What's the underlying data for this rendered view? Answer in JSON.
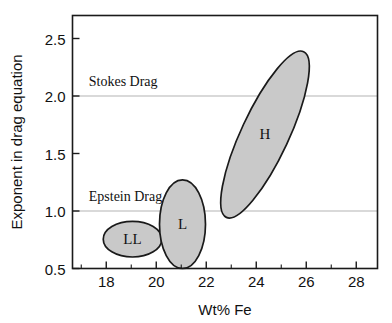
{
  "chart_data": {
    "type": "scatter",
    "title": "",
    "xlabel": "Wt% Fe",
    "ylabel": "Exponent in drag equation",
    "xlim": [
      16.65,
      28.85
    ],
    "ylim": [
      0.5,
      2.7
    ],
    "grid": true,
    "legend_position": "none",
    "xticks": [
      18,
      20,
      22,
      24,
      26,
      28
    ],
    "xtick_labels": [
      "18",
      "20",
      "22",
      "24",
      "26",
      "28"
    ],
    "xminor_ticks": [
      17,
      19,
      21,
      23,
      25,
      27
    ],
    "yticks": [
      0.5,
      1.0,
      1.5,
      2.0,
      2.5
    ],
    "ytick_labels": [
      "0.5",
      "1.0",
      "1.5",
      "2.0",
      "2.5"
    ],
    "gridlines_y": [
      1.0,
      2.0
    ],
    "annotations": [
      {
        "text": "Stokes Drag",
        "x": 17.3,
        "y": 2.09
      },
      {
        "text": "Epstein Drag",
        "x": 17.3,
        "y": 1.09
      }
    ],
    "ellipses": [
      {
        "label": "LL",
        "cx": 19.05,
        "cy": 0.755,
        "rx": 1.17,
        "ry": 0.155,
        "rotation": 0
      },
      {
        "label": "L",
        "cx": 21.05,
        "cy": 0.885,
        "rx": 0.92,
        "ry": 0.385,
        "rotation": 0
      },
      {
        "label": "H",
        "cx": 24.35,
        "cy": 1.665,
        "rx": 0.95,
        "ry": 0.795,
        "rotation": 25
      }
    ],
    "series_fill_color": "#c9c9c9",
    "series_stroke_color": "#1a1a1a",
    "gridline_color": "#b4b4b4",
    "axis_color": "#1a1a1a"
  }
}
